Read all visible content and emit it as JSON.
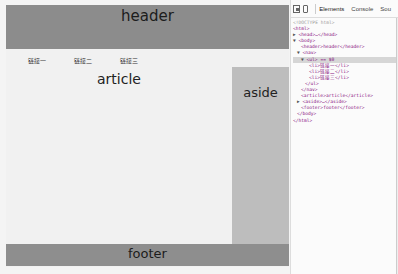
{
  "page": {
    "header": {
      "text": "header"
    },
    "nav": {
      "links": [
        "链接一",
        "链接二",
        "链接三"
      ]
    },
    "article": {
      "text": "article"
    },
    "aside": {
      "text": "aside"
    },
    "footer": {
      "text": "footer"
    }
  },
  "colors": {
    "header_bg": "#8c8c8c",
    "aside_bg": "#bdbdbd",
    "footer_bg": "#8e8e8e",
    "page_bg": "#f1f1f1"
  },
  "devtools": {
    "tabs": [
      "Elements",
      "Console",
      "Sou"
    ],
    "active_tab": "Elements",
    "tree": [
      {
        "indent": 0,
        "twisty": "",
        "text": "<!DOCTYPE html>",
        "type": "comment"
      },
      {
        "indent": 0,
        "twisty": "",
        "text": "<html>",
        "type": "tag"
      },
      {
        "indent": 0,
        "twisty": "▶",
        "text": "<head>…</head>",
        "type": "tag"
      },
      {
        "indent": 0,
        "twisty": "▼",
        "text": "<body>",
        "type": "tag"
      },
      {
        "indent": 2,
        "twisty": "",
        "text": "<header>header</header>",
        "type": "tag"
      },
      {
        "indent": 1,
        "twisty": "▼",
        "text": "<nav>",
        "type": "tag"
      },
      {
        "indent": 2,
        "twisty": "▼",
        "text": "<ul> == $0",
        "type": "tag",
        "selected": true
      },
      {
        "indent": 4,
        "twisty": "",
        "text": "<li>链接一</li>",
        "type": "tag"
      },
      {
        "indent": 4,
        "twisty": "",
        "text": "<li>链接二</li>",
        "type": "tag"
      },
      {
        "indent": 4,
        "twisty": "",
        "text": "<li>链接三</li>",
        "type": "tag"
      },
      {
        "indent": 3,
        "twisty": "",
        "text": "</ul>",
        "type": "tag"
      },
      {
        "indent": 2,
        "twisty": "",
        "text": "</nav>",
        "type": "tag"
      },
      {
        "indent": 2,
        "twisty": "",
        "text": "<article>article</article>",
        "type": "tag"
      },
      {
        "indent": 1,
        "twisty": "▶",
        "text": "<aside>…</aside>",
        "type": "tag"
      },
      {
        "indent": 2,
        "twisty": "",
        "text": "<footer>footer</footer>",
        "type": "tag"
      },
      {
        "indent": 1,
        "twisty": "",
        "text": "</body>",
        "type": "tag"
      },
      {
        "indent": 0,
        "twisty": "",
        "text": "</html>",
        "type": "tag"
      }
    ]
  }
}
